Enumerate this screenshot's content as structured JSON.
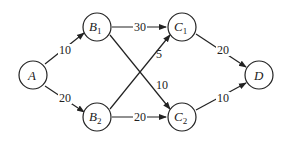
{
  "diagram": {
    "type": "directed-network",
    "nodes": [
      {
        "id": "A",
        "label": "A",
        "sub": ""
      },
      {
        "id": "B1",
        "label": "B",
        "sub": "1"
      },
      {
        "id": "B2",
        "label": "B",
        "sub": "2"
      },
      {
        "id": "C1",
        "label": "C",
        "sub": "1"
      },
      {
        "id": "C2",
        "label": "C",
        "sub": "2"
      },
      {
        "id": "D",
        "label": "D",
        "sub": ""
      }
    ],
    "edges": [
      {
        "from": "A",
        "to": "B1",
        "weight": "10"
      },
      {
        "from": "A",
        "to": "B2",
        "weight": "20"
      },
      {
        "from": "B1",
        "to": "C1",
        "weight": "30"
      },
      {
        "from": "B1",
        "to": "C2",
        "weight": "10"
      },
      {
        "from": "B2",
        "to": "C1",
        "weight": "5"
      },
      {
        "from": "B2",
        "to": "C2",
        "weight": "20"
      },
      {
        "from": "C1",
        "to": "D",
        "weight": "20"
      },
      {
        "from": "C2",
        "to": "D",
        "weight": "10"
      }
    ]
  }
}
